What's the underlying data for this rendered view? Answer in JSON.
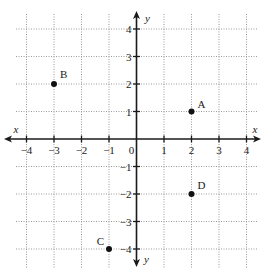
{
  "chart_data": {
    "type": "scatter",
    "title": "",
    "xlabel": "x",
    "ylabel": "y",
    "xlim": [
      -4,
      4
    ],
    "ylim": [
      -4,
      4
    ],
    "grid": true,
    "grid_style": "dotted",
    "x_ticks": [
      -4,
      -3,
      -2,
      -1,
      0,
      1,
      2,
      3,
      4
    ],
    "y_ticks": [
      4,
      3,
      2,
      1,
      -1,
      -2,
      -3,
      -4
    ],
    "x_tick_labels": [
      "−4",
      "−3",
      "−2",
      "−1",
      "0",
      "1",
      "2",
      "3",
      "4"
    ],
    "y_tick_labels": [
      "4",
      "3",
      "2",
      "1",
      "−1",
      "−2",
      "−3",
      "−4"
    ],
    "points": [
      {
        "label": "A",
        "x": 2,
        "y": 1
      },
      {
        "label": "B",
        "x": -3,
        "y": 2
      },
      {
        "label": "C",
        "x": -1,
        "y": -4
      },
      {
        "label": "D",
        "x": 2,
        "y": -2
      }
    ],
    "colors": {
      "axis": "#1a1a1a",
      "grid": "#9a9a9a",
      "point": "#111111"
    }
  }
}
